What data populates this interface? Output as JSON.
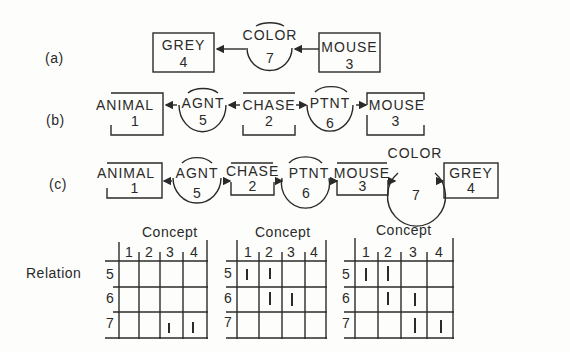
{
  "rows": {
    "a": {
      "label": "(a)",
      "nodes": [
        {
          "type": "concept",
          "label": "GREY",
          "id": "4"
        },
        {
          "type": "relation",
          "label": "COLOR",
          "id": "7"
        },
        {
          "type": "concept",
          "label": "MOUSE",
          "id": "3"
        }
      ]
    },
    "b": {
      "label": "(b)",
      "nodes": [
        {
          "type": "concept",
          "label": "ANIMAL",
          "id": "1"
        },
        {
          "type": "relation",
          "label": "AGNT",
          "id": "5"
        },
        {
          "type": "concept",
          "label": "CHASE",
          "id": "2"
        },
        {
          "type": "relation",
          "label": "PTNT",
          "id": "6"
        },
        {
          "type": "concept",
          "label": "MOUSE",
          "id": "3"
        }
      ]
    },
    "c": {
      "label": "(c)",
      "nodes": [
        {
          "type": "concept",
          "label": "ANIMAL",
          "id": "1"
        },
        {
          "type": "relation",
          "label": "AGNT",
          "id": "5"
        },
        {
          "type": "concept",
          "label": "CHASE",
          "id": "2"
        },
        {
          "type": "relation",
          "label": "PTNT",
          "id": "6"
        },
        {
          "type": "concept",
          "label": "MOUSE",
          "id": "3"
        },
        {
          "type": "relation",
          "label": "COLOR",
          "id": "7"
        },
        {
          "type": "concept",
          "label": "GREY",
          "id": "4"
        }
      ]
    }
  },
  "matrices": {
    "row_axis_label": "Relation",
    "col_axis_label": "Concept",
    "columns": [
      "1",
      "2",
      "3",
      "4"
    ],
    "rows": [
      "5",
      "6",
      "7"
    ],
    "tables": [
      {
        "for": "(a)",
        "header": "Concept",
        "marks": [
          [
            0,
            0,
            0,
            0
          ],
          [
            0,
            0,
            0,
            0
          ],
          [
            0,
            0,
            1,
            1
          ]
        ]
      },
      {
        "for": "(b)",
        "header": "Concept",
        "marks": [
          [
            1,
            1,
            0,
            0
          ],
          [
            0,
            1,
            1,
            0
          ],
          [
            0,
            0,
            0,
            0
          ]
        ]
      },
      {
        "for": "(c)",
        "header": "Concept",
        "marks": [
          [
            1,
            1,
            0,
            0
          ],
          [
            0,
            1,
            1,
            0
          ],
          [
            0,
            0,
            1,
            1
          ]
        ]
      }
    ]
  }
}
